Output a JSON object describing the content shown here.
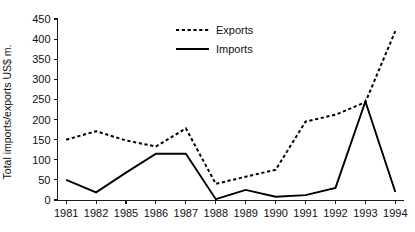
{
  "chart_data": {
    "type": "line",
    "title": "",
    "xlabel": "",
    "ylabel": "Total imports/exports US$ m.",
    "categories": [
      "1981",
      "1982",
      "1985",
      "1986",
      "1987",
      "1988",
      "1989",
      "1990",
      "1991",
      "1992",
      "1993",
      "1994"
    ],
    "ylim": [
      0,
      450
    ],
    "yticks": [
      0,
      50,
      100,
      150,
      200,
      250,
      300,
      350,
      400,
      450
    ],
    "ytick_labels": [
      "0",
      "50",
      "100",
      "150",
      "200",
      "250",
      "300",
      "350",
      "400",
      "450"
    ],
    "grid": false,
    "legend_position": "top-center",
    "series": [
      {
        "name": "Exports",
        "style": "dotted",
        "values": [
          150,
          171,
          148,
          133,
          178,
          40,
          58,
          75,
          195,
          212,
          243,
          420
        ]
      },
      {
        "name": "Imports",
        "style": "solid",
        "values": [
          50,
          19,
          68,
          115,
          115,
          2,
          25,
          8,
          12,
          30,
          245,
          20
        ]
      }
    ]
  },
  "legend": {
    "items": [
      {
        "label": "Exports",
        "style": "dotted"
      },
      {
        "label": "Imports",
        "style": "solid"
      }
    ]
  },
  "axes": {
    "y_title": "Total imports/exports US$ m."
  }
}
